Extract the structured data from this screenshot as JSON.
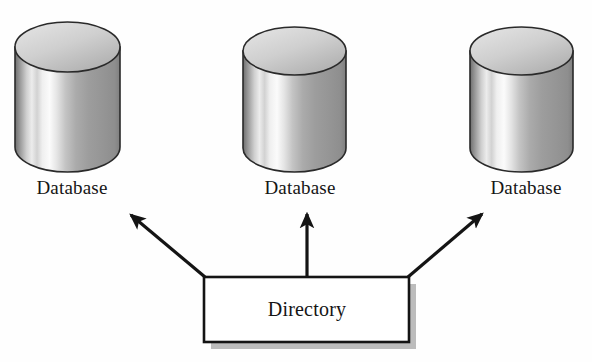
{
  "diagram": {
    "type": "block-diagram",
    "background_color": "#fefefe",
    "line_color": "#1a1a1a",
    "shadow_color": "#b8b8b8"
  },
  "databases": [
    {
      "id": "database-left",
      "label": "Database",
      "shape": "cylinder",
      "position": {
        "x": 15,
        "y": 22,
        "width": 105,
        "height": 150
      }
    },
    {
      "id": "database-center",
      "label": "Database",
      "shape": "cylinder",
      "position": {
        "x": 243,
        "y": 27,
        "width": 103,
        "height": 145
      }
    },
    {
      "id": "database-right",
      "label": "Database",
      "shape": "cylinder",
      "position": {
        "x": 470,
        "y": 27,
        "width": 103,
        "height": 145
      }
    }
  ],
  "directory": {
    "id": "directory-box",
    "label": "Directory",
    "shape": "rectangle-with-shadow",
    "position": {
      "x": 204,
      "y": 277,
      "width": 205,
      "height": 65
    }
  },
  "connectors": [
    {
      "id": "arrow-to-left-database",
      "from": "directory",
      "to": "database-left",
      "direction": "up-left",
      "arrowhead": "target"
    },
    {
      "id": "arrow-to-center-database",
      "from": "directory",
      "to": "database-center",
      "direction": "up",
      "arrowhead": "target"
    },
    {
      "id": "arrow-to-right-database",
      "from": "directory",
      "to": "database-right",
      "direction": "up-right",
      "arrowhead": "target"
    }
  ]
}
